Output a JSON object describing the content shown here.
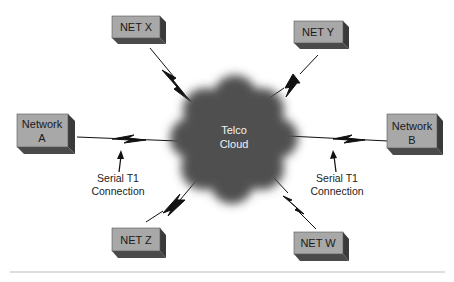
{
  "diagram": {
    "cloud": {
      "label_line1": "Telco",
      "label_line2": "Cloud"
    },
    "nodes": {
      "net_x": {
        "label": "NET X"
      },
      "net_y": {
        "label": "NET Y"
      },
      "network_a": {
        "label_line1": "Network",
        "label_line2": "A"
      },
      "network_b": {
        "label_line1": "Network",
        "label_line2": "B"
      },
      "net_z": {
        "label": "NET Z"
      },
      "net_w": {
        "label": "NET W"
      }
    },
    "annotations": {
      "left": {
        "line1": "Serial T1",
        "line2": "Connection"
      },
      "right": {
        "line1": "Serial T1",
        "line2": "Connection"
      }
    },
    "colors": {
      "box_face": "#a8a8a8",
      "box_side": "#4a4a4a",
      "cloud": "#555555",
      "line": "#111111"
    }
  }
}
